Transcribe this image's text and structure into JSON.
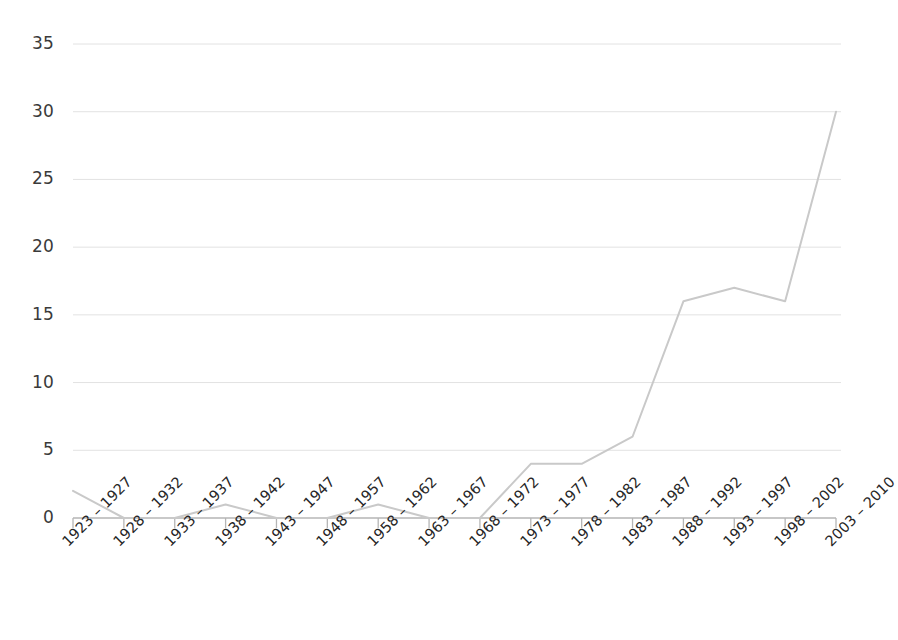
{
  "chart_data": {
    "type": "line",
    "title": "",
    "subtitle": "",
    "xlabel": "",
    "ylabel": "",
    "categories": [
      "1923 – 1927",
      "1928 – 1932",
      "1933 – 1937",
      "1938 – 1942",
      "1943 – 1947",
      "1948 – 1957",
      "1958 – 1962",
      "1963 – 1967",
      "1968 – 1972",
      "1973 – 1977",
      "1978 – 1982",
      "1983 – 1987",
      "1988 – 1992",
      "1993 – 1997",
      "1998 – 2002",
      "2003 – 2010"
    ],
    "values": [
      2,
      0,
      0,
      1,
      0,
      0,
      1,
      0,
      0,
      4,
      4,
      6,
      16,
      17,
      16,
      30
    ],
    "series": [
      {
        "name": "count",
        "values": [
          2,
          0,
          0,
          1,
          0,
          0,
          1,
          0,
          0,
          4,
          4,
          6,
          16,
          17,
          16,
          30
        ]
      }
    ],
    "ylim": [
      0,
      35
    ],
    "ytick_values": [
      0,
      5,
      10,
      15,
      20,
      25,
      30,
      35
    ],
    "ytick_labels": [
      "0",
      "5",
      "10",
      "15",
      "20",
      "25",
      "30",
      "35"
    ],
    "xlim": [
      0,
      15
    ],
    "grid": "horizontal",
    "legend": "none",
    "line_color": "#c9c9c9",
    "gridline_color": "#e2e2e2",
    "axis_color": "#b5b5b5",
    "label_color": "#2b2b2b",
    "background_color": "#ffffff",
    "markers": "none",
    "line_width": 2
  }
}
